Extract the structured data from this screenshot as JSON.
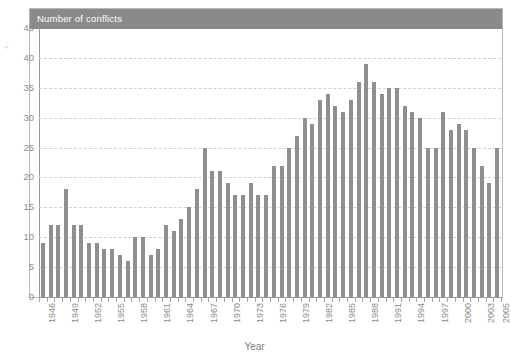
{
  "chart_data": {
    "type": "bar",
    "title": "Number of conflicts",
    "xlabel": "Year",
    "ylabel": "",
    "ylim": [
      0,
      45
    ],
    "ytick_step": 5,
    "yticks": [
      45,
      40,
      35,
      30,
      25,
      20,
      15,
      10,
      5,
      0
    ],
    "grid": true,
    "legend": false,
    "bar_color": "#8f8f8f",
    "title_banner_color": "#8a8a8a",
    "axis_color": "#9a9a9a",
    "gridline_color": "#d2d2cc",
    "xtick_label_step": 3,
    "xtick_labels": [
      "1946",
      "1949",
      "1952",
      "1955",
      "1958",
      "1961",
      "1964",
      "1967",
      "1970",
      "1973",
      "1976",
      "1979",
      "1982",
      "1985",
      "1988",
      "1991",
      "1994",
      "1997",
      "2000",
      "2003",
      "2005"
    ],
    "categories": [
      "1946",
      "1947",
      "1948",
      "1949",
      "1950",
      "1951",
      "1952",
      "1953",
      "1954",
      "1955",
      "1956",
      "1957",
      "1958",
      "1959",
      "1960",
      "1961",
      "1962",
      "1963",
      "1964",
      "1965",
      "1966",
      "1967",
      "1968",
      "1969",
      "1970",
      "1971",
      "1972",
      "1973",
      "1974",
      "1975",
      "1976",
      "1977",
      "1978",
      "1979",
      "1980",
      "1981",
      "1982",
      "1983",
      "1984",
      "1985",
      "1986",
      "1987",
      "1988",
      "1989",
      "1990",
      "1991",
      "1992",
      "1993",
      "1994",
      "1995",
      "1996",
      "1997",
      "1998",
      "1999",
      "2000",
      "2001",
      "2002",
      "2003",
      "2004",
      "2005"
    ],
    "values": [
      9,
      12,
      12,
      18,
      12,
      12,
      9,
      9,
      8,
      8,
      7,
      6,
      10,
      10,
      7,
      8,
      12,
      11,
      13,
      15,
      18,
      25,
      21,
      21,
      19,
      17,
      17,
      19,
      17,
      17,
      22,
      22,
      25,
      27,
      30,
      29,
      33,
      34,
      32,
      31,
      33,
      36,
      39,
      36,
      34,
      35,
      35,
      32,
      31,
      30,
      25,
      25,
      31,
      28,
      29,
      28,
      25,
      22,
      19,
      25
    ]
  },
  "stray_mark": "+"
}
